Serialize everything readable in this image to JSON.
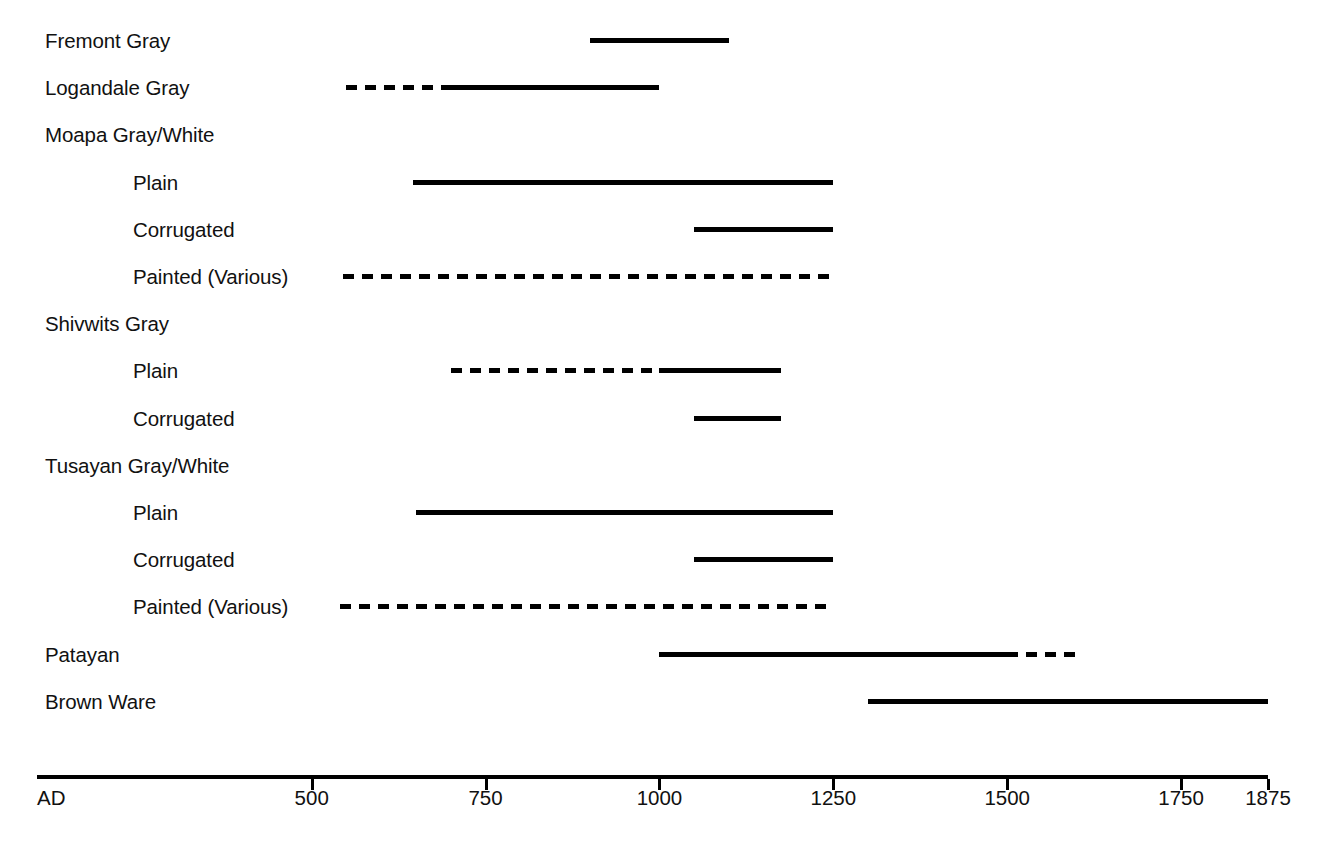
{
  "chart_data": {
    "type": "bar",
    "title": "",
    "subtitle": "",
    "xlabel": "",
    "ylabel": "",
    "orientation": "horizontal",
    "grid": false,
    "legend": "none",
    "xlim": [
      105,
      1875
    ],
    "axis": {
      "origin_label": "AD",
      "ticks": [
        500,
        750,
        1000,
        1250,
        1500,
        1750,
        1875
      ],
      "tick_labels": [
        "500",
        "750",
        "1000",
        "1250",
        "1500",
        "1750",
        "1875"
      ],
      "axis_start_year": 105,
      "axis_end_year": 1875
    },
    "line_styles": {
      "solid": "solid",
      "dashed": "dashed"
    },
    "colors": {
      "line": "#000000",
      "text": "#111111",
      "background": "#ffffff"
    },
    "rows": [
      {
        "label": "Fremont Gray",
        "indent": false,
        "header_only": false,
        "segments": [
          {
            "start": 900,
            "end": 1100,
            "style": "solid"
          }
        ]
      },
      {
        "label": "Logandale Gray",
        "indent": false,
        "header_only": false,
        "segments": [
          {
            "start": 550,
            "end": 700,
            "style": "dashed"
          },
          {
            "start": 700,
            "end": 1000,
            "style": "solid"
          }
        ]
      },
      {
        "label": "Moapa Gray/White",
        "indent": false,
        "header_only": true,
        "segments": []
      },
      {
        "label": "Plain",
        "indent": true,
        "header_only": false,
        "segments": [
          {
            "start": 645,
            "end": 1250,
            "style": "solid"
          }
        ]
      },
      {
        "label": "Corrugated",
        "indent": true,
        "header_only": false,
        "segments": [
          {
            "start": 1050,
            "end": 1250,
            "style": "solid"
          }
        ]
      },
      {
        "label": "Painted (Various)",
        "indent": true,
        "header_only": false,
        "segments": [
          {
            "start": 545,
            "end": 1250,
            "style": "dashed"
          }
        ]
      },
      {
        "label": "Shivwits Gray",
        "indent": false,
        "header_only": true,
        "segments": []
      },
      {
        "label": "Plain",
        "indent": true,
        "header_only": false,
        "segments": [
          {
            "start": 700,
            "end": 1000,
            "style": "dashed"
          },
          {
            "start": 1000,
            "end": 1175,
            "style": "solid"
          }
        ]
      },
      {
        "label": "Corrugated",
        "indent": true,
        "header_only": false,
        "segments": [
          {
            "start": 1050,
            "end": 1175,
            "style": "solid"
          }
        ]
      },
      {
        "label": "Tusayan Gray/White",
        "indent": false,
        "header_only": true,
        "segments": []
      },
      {
        "label": "Plain",
        "indent": true,
        "header_only": false,
        "segments": [
          {
            "start": 650,
            "end": 1250,
            "style": "solid"
          }
        ]
      },
      {
        "label": "Corrugated",
        "indent": true,
        "header_only": false,
        "segments": [
          {
            "start": 1050,
            "end": 1250,
            "style": "solid"
          }
        ]
      },
      {
        "label": "Painted (Various)",
        "indent": true,
        "header_only": false,
        "segments": [
          {
            "start": 540,
            "end": 1250,
            "style": "dashed"
          }
        ]
      },
      {
        "label": "Patayan",
        "indent": false,
        "header_only": false,
        "segments": [
          {
            "start": 1000,
            "end": 1500,
            "style": "solid"
          },
          {
            "start": 1500,
            "end": 1600,
            "style": "dashed"
          }
        ]
      },
      {
        "label": "Brown Ware",
        "indent": false,
        "header_only": false,
        "segments": [
          {
            "start": 1300,
            "end": 1875,
            "style": "solid"
          }
        ]
      }
    ]
  },
  "layout": {
    "plot_left_px": 37,
    "plot_right_px": 1268,
    "first_row_y_px": 41,
    "row_step_px": 47.2,
    "label_x_px": 45,
    "label_indent_x_px": 133,
    "axis_y_px": 775,
    "tick_label_y_px": 788
  }
}
